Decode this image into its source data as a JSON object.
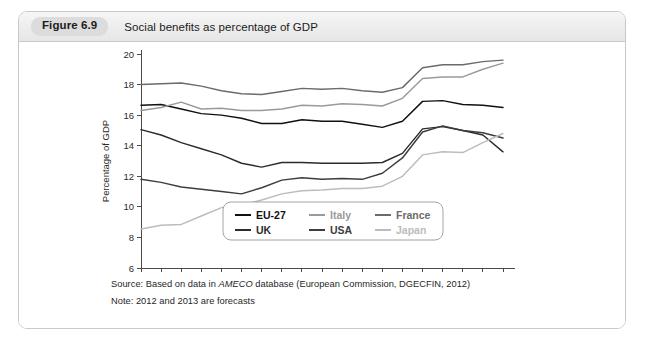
{
  "figure": {
    "badge": "Figure 6.9",
    "caption": "Social benefits as percentage of GDP"
  },
  "notes": {
    "source_prefix": "Source: Based on data in ",
    "source_italic": "AMECO",
    "source_suffix": " database (European Commission, DGECFIN, 2012)",
    "note": "Note: 2012 and 2013 are forecasts"
  },
  "colors": {
    "eu27": "#111111",
    "uk": "#2b2b2b",
    "italy": "#9a9a9a",
    "usa": "#3d3d3d",
    "france": "#6b6b6b",
    "japan": "#bcbcbc",
    "axis": "#4a4a4a",
    "panel_border": "#c9c9c9",
    "badge_bg": "#dcdcdc"
  },
  "chart_data": {
    "type": "line",
    "title": "Social benefits as percentage of GDP",
    "xlabel": "",
    "ylabel": "Percentage of GDP",
    "xlim": [
      1995,
      2013
    ],
    "ylim": [
      6,
      20
    ],
    "ytick_labels": [
      "6",
      "8",
      "10",
      "12",
      "14",
      "16",
      "18",
      "20"
    ],
    "yticks": [
      6,
      8,
      10,
      12,
      14,
      16,
      18,
      20
    ],
    "xtick_labels": [
      "1995",
      "2000",
      "2005",
      "2010"
    ],
    "xticks_major": [
      1995,
      2000,
      2005,
      2010
    ],
    "xticks_minor": [
      1995,
      1996,
      1997,
      1998,
      1999,
      2000,
      2001,
      2002,
      2003,
      2004,
      2005,
      2006,
      2007,
      2008,
      2009,
      2010,
      2011,
      2012,
      2013
    ],
    "grid": false,
    "legend_position": "inside-bottom-center",
    "x": [
      1995,
      1996,
      1997,
      1998,
      1999,
      2000,
      2001,
      2002,
      2003,
      2004,
      2005,
      2006,
      2007,
      2008,
      2009,
      2010,
      2011,
      2012,
      2013
    ],
    "series": [
      {
        "name": "EU-27",
        "color": "#111111",
        "values": [
          16.65,
          16.7,
          16.4,
          16.1,
          16.0,
          15.8,
          15.45,
          15.45,
          15.7,
          15.6,
          15.6,
          15.4,
          15.2,
          15.6,
          16.9,
          16.95,
          16.7,
          16.65,
          16.5
        ]
      },
      {
        "name": "UK",
        "color": "#2b2b2b",
        "values": [
          15.05,
          14.7,
          14.2,
          13.8,
          13.4,
          12.85,
          12.6,
          12.9,
          12.9,
          12.85,
          12.85,
          12.85,
          12.9,
          13.5,
          15.1,
          15.25,
          15.0,
          14.7,
          13.6
        ]
      },
      {
        "name": "Italy",
        "color": "#9a9a9a",
        "values": [
          16.3,
          16.5,
          16.85,
          16.4,
          16.45,
          16.3,
          16.3,
          16.4,
          16.65,
          16.6,
          16.75,
          16.7,
          16.6,
          17.1,
          18.4,
          18.5,
          18.5,
          19.0,
          19.4
        ]
      },
      {
        "name": "USA",
        "color": "#3d3d3d",
        "values": [
          11.8,
          11.6,
          11.3,
          11.15,
          11.0,
          10.85,
          11.25,
          11.75,
          11.9,
          11.8,
          11.85,
          11.8,
          12.2,
          13.2,
          14.9,
          15.3,
          15.0,
          14.85,
          14.5
        ]
      },
      {
        "name": "France",
        "color": "#6b6b6b",
        "values": [
          18.0,
          18.05,
          18.1,
          17.9,
          17.6,
          17.4,
          17.35,
          17.55,
          17.75,
          17.7,
          17.75,
          17.6,
          17.5,
          17.8,
          19.1,
          19.3,
          19.3,
          19.5,
          19.6
        ]
      },
      {
        "name": "Japan",
        "color": "#bcbcbc",
        "values": [
          8.55,
          8.8,
          8.85,
          9.4,
          9.95,
          10.1,
          10.45,
          10.85,
          11.05,
          11.1,
          11.2,
          11.2,
          11.35,
          12.0,
          13.4,
          13.6,
          13.55,
          14.2,
          14.8
        ]
      }
    ],
    "legend": [
      [
        "EU-27",
        "Italy",
        "France"
      ],
      [
        "UK",
        "USA",
        "Japan"
      ]
    ]
  }
}
